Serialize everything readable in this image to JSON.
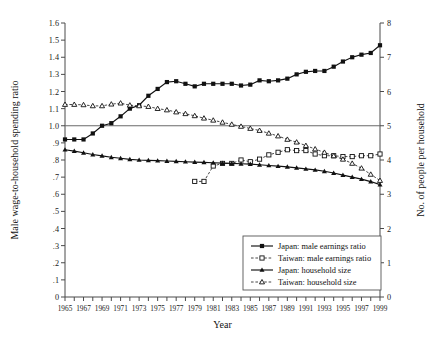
{
  "chart_data": {
    "type": "line",
    "title": "",
    "xlabel": "Year",
    "ylabel": "Male wage-to-household spending ratio",
    "y2label": "No. of people per household",
    "xlim": [
      1965,
      1999
    ],
    "ylim": [
      0,
      1.6
    ],
    "y2lim": [
      0,
      8
    ],
    "grid": false,
    "legend_position": "bottom-right",
    "reference_line_y": 1.0,
    "yticklabels": [
      "0",
      ".1",
      ".2",
      ".3",
      ".4",
      ".5",
      ".6",
      ".7",
      ".8",
      ".9",
      "1.0",
      "1.1",
      "1.2",
      "1.3",
      "1.4",
      "1.5",
      "1.6"
    ],
    "ytickvalues": [
      0,
      0.1,
      0.2,
      0.3,
      0.4,
      0.5,
      0.6,
      0.7,
      0.8,
      0.9,
      1.0,
      1.1,
      1.2,
      1.3,
      1.4,
      1.5,
      1.6
    ],
    "y2ticklabels": [
      "0",
      "1",
      "2",
      "3",
      "4",
      "5",
      "6",
      "7",
      "8"
    ],
    "y2tickvalues": [
      0,
      1,
      2,
      3,
      4,
      5,
      6,
      7,
      8
    ],
    "xticklabels": [
      "1965",
      "1967",
      "1969",
      "1971",
      "1973",
      "1975",
      "1977",
      "1979",
      "1981",
      "1983",
      "1985",
      "1987",
      "1989",
      "1991",
      "1993",
      "1995",
      "1997",
      "1999"
    ],
    "xtickvalues": [
      1965,
      1967,
      1969,
      1971,
      1973,
      1975,
      1977,
      1979,
      1981,
      1983,
      1985,
      1987,
      1989,
      1991,
      1993,
      1995,
      1997,
      1999
    ],
    "x_minor_every": 1,
    "series": [
      {
        "name": "Japan: male earnings ratio",
        "axis": "left",
        "marker": "filled-square",
        "line": "solid",
        "x": [
          1965,
          1966,
          1967,
          1968,
          1969,
          1970,
          1971,
          1972,
          1973,
          1974,
          1975,
          1976,
          1977,
          1978,
          1979,
          1980,
          1981,
          1982,
          1983,
          1984,
          1985,
          1986,
          1987,
          1988,
          1989,
          1990,
          1991,
          1992,
          1993,
          1994,
          1995,
          1996,
          1997,
          1998,
          1999
        ],
        "values": [
          0.92,
          0.92,
          0.92,
          0.955,
          1.0,
          1.015,
          1.055,
          1.1,
          1.12,
          1.175,
          1.215,
          1.255,
          1.26,
          1.245,
          1.23,
          1.245,
          1.245,
          1.245,
          1.245,
          1.235,
          1.24,
          1.265,
          1.26,
          1.265,
          1.275,
          1.3,
          1.315,
          1.32,
          1.32,
          1.345,
          1.375,
          1.4,
          1.415,
          1.425,
          1.47
        ]
      },
      {
        "name": "Taiwan: male earnings ratio",
        "axis": "left",
        "marker": "open-square",
        "line": "dashed",
        "x": [
          1979,
          1980,
          1981,
          1982,
          1983,
          1984,
          1985,
          1986,
          1987,
          1988,
          1989,
          1990,
          1991,
          1992,
          1993,
          1994,
          1995,
          1996,
          1997,
          1998,
          1999
        ],
        "values": [
          0.675,
          0.675,
          0.765,
          0.78,
          0.78,
          0.8,
          0.79,
          0.805,
          0.83,
          0.845,
          0.86,
          0.855,
          0.855,
          0.835,
          0.825,
          0.825,
          0.82,
          0.82,
          0.825,
          0.825,
          0.835
        ]
      },
      {
        "name": "Japan: household size",
        "axis": "right",
        "marker": "filled-triangle",
        "line": "solid",
        "x": [
          1965,
          1966,
          1967,
          1968,
          1969,
          1970,
          1971,
          1972,
          1973,
          1974,
          1975,
          1976,
          1977,
          1978,
          1979,
          1980,
          1981,
          1982,
          1983,
          1984,
          1985,
          1986,
          1987,
          1988,
          1989,
          1990,
          1991,
          1992,
          1993,
          1994,
          1995,
          1996,
          1997,
          1998,
          1999
        ],
        "values": [
          4.3,
          4.26,
          4.21,
          4.16,
          4.12,
          4.08,
          4.05,
          4.02,
          4.0,
          3.99,
          3.98,
          3.97,
          3.96,
          3.95,
          3.94,
          3.93,
          3.92,
          3.91,
          3.9,
          3.89,
          3.88,
          3.86,
          3.84,
          3.82,
          3.8,
          3.77,
          3.74,
          3.71,
          3.67,
          3.62,
          3.56,
          3.5,
          3.44,
          3.37,
          3.28
        ]
      },
      {
        "name": "Taiwan: household size",
        "axis": "right",
        "marker": "open-triangle",
        "line": "dashed",
        "x": [
          1965,
          1966,
          1967,
          1968,
          1969,
          1970,
          1971,
          1972,
          1973,
          1974,
          1975,
          1976,
          1977,
          1978,
          1979,
          1980,
          1981,
          1982,
          1983,
          1984,
          1985,
          1986,
          1987,
          1988,
          1989,
          1990,
          1991,
          1992,
          1993,
          1994,
          1995,
          1996,
          1997,
          1998,
          1999
        ],
        "values": [
          5.62,
          5.62,
          5.61,
          5.58,
          5.58,
          5.63,
          5.66,
          5.6,
          5.58,
          5.56,
          5.5,
          5.46,
          5.4,
          5.35,
          5.29,
          5.22,
          5.16,
          5.1,
          5.04,
          4.98,
          4.92,
          4.86,
          4.78,
          4.7,
          4.6,
          4.52,
          4.42,
          4.32,
          4.22,
          4.12,
          4.02,
          3.9,
          3.76,
          3.58,
          3.4
        ]
      }
    ]
  },
  "legend": {
    "items": [
      {
        "label": "Japan: male earnings ratio"
      },
      {
        "label": "Taiwan: male earnings ratio"
      },
      {
        "label": "Japan: household size"
      },
      {
        "label": "Taiwan: household size"
      }
    ]
  }
}
